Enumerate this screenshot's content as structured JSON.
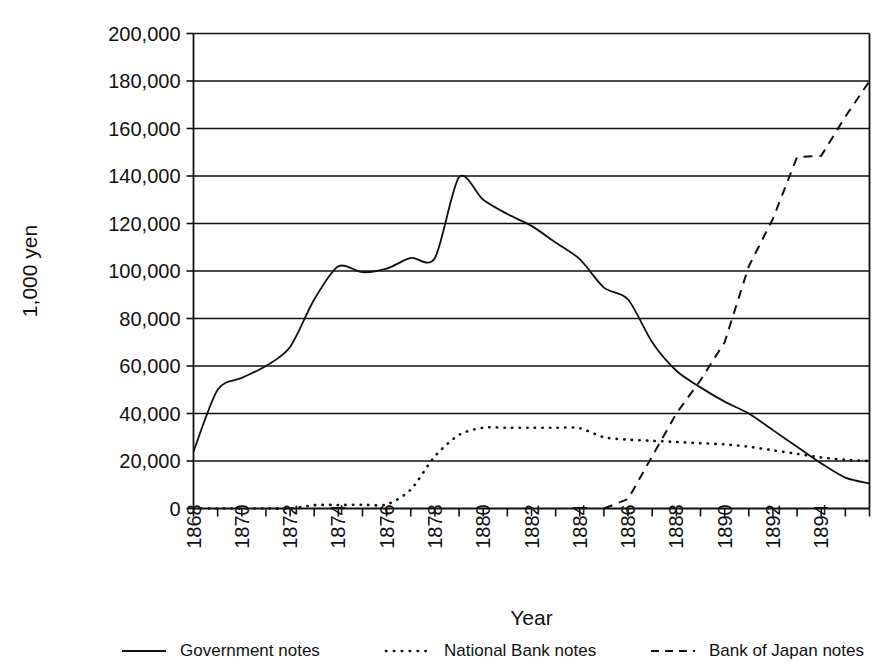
{
  "chart_data": {
    "type": "line",
    "title": "",
    "xlabel": "Year",
    "ylabel": "1,000 yen",
    "xlim": [
      1868,
      1896
    ],
    "ylim": [
      0,
      200000
    ],
    "grid": true,
    "legend_position": "bottom",
    "y_ticks": [
      0,
      20000,
      40000,
      60000,
      80000,
      100000,
      120000,
      140000,
      160000,
      180000,
      200000
    ],
    "y_tick_labels": [
      "0",
      "20,000",
      "40,000",
      "60,000",
      "80,000",
      "100,000",
      "120,000",
      "140,000",
      "160,000",
      "180,000",
      "200,000"
    ],
    "x_ticks": [
      1868,
      1869,
      1870,
      1871,
      1872,
      1873,
      1874,
      1875,
      1876,
      1877,
      1878,
      1879,
      1880,
      1881,
      1882,
      1883,
      1884,
      1885,
      1886,
      1887,
      1888,
      1889,
      1890,
      1891,
      1892,
      1893,
      1894,
      1895,
      1896
    ],
    "x_tick_labels": [
      "1868",
      "",
      "1870",
      "",
      "1872",
      "",
      "1874",
      "",
      "1876",
      "",
      "1878",
      "",
      "1880",
      "",
      "1882",
      "",
      "1884",
      "",
      "1886",
      "",
      "1888",
      "",
      "1890",
      "",
      "1892",
      "",
      "1894",
      "",
      ""
    ],
    "series": [
      {
        "name": "Government notes",
        "style": "solid",
        "x": [
          1868,
          1869,
          1870,
          1871,
          1872,
          1873,
          1874,
          1875,
          1876,
          1877,
          1878,
          1879,
          1880,
          1881,
          1882,
          1883,
          1884,
          1885,
          1886,
          1887,
          1888,
          1889,
          1890,
          1891,
          1892,
          1893,
          1894,
          1895,
          1896
        ],
        "values": [
          24000,
          50000,
          55000,
          60000,
          68000,
          88000,
          102000,
          99500,
          101000,
          105500,
          105500,
          139500,
          130000,
          124000,
          119000,
          112000,
          105000,
          93000,
          88000,
          70000,
          58000,
          51000,
          45000,
          40000,
          33000,
          26000,
          19000,
          13000,
          10500
        ]
      },
      {
        "name": "National Bank notes",
        "style": "dotted",
        "x": [
          1868,
          1869,
          1870,
          1871,
          1872,
          1873,
          1874,
          1875,
          1876,
          1877,
          1878,
          1879,
          1880,
          1881,
          1882,
          1883,
          1884,
          1885,
          1886,
          1887,
          1888,
          1889,
          1890,
          1891,
          1892,
          1893,
          1894,
          1895,
          1896
        ],
        "values": [
          0,
          0,
          0,
          0,
          0,
          1400,
          1500,
          1600,
          1700,
          8000,
          22000,
          31000,
          34000,
          34000,
          34000,
          34000,
          33800,
          30000,
          29000,
          28500,
          28000,
          27500,
          27000,
          26000,
          24500,
          23000,
          21500,
          20500,
          20000
        ]
      },
      {
        "name": "Bank of Japan notes",
        "style": "dashed",
        "x": [
          1885,
          1886,
          1887,
          1888,
          1889,
          1890,
          1891,
          1892,
          1893,
          1894,
          1895,
          1896
        ],
        "values": [
          0,
          4000,
          22000,
          40000,
          54000,
          70000,
          102000,
          122000,
          148000,
          148500,
          165000,
          180000
        ]
      }
    ]
  },
  "legend": {
    "items": [
      {
        "label": "Government notes",
        "style": "solid"
      },
      {
        "label": "National Bank notes",
        "style": "dotted"
      },
      {
        "label": "Bank of Japan notes",
        "style": "dashed"
      }
    ]
  }
}
